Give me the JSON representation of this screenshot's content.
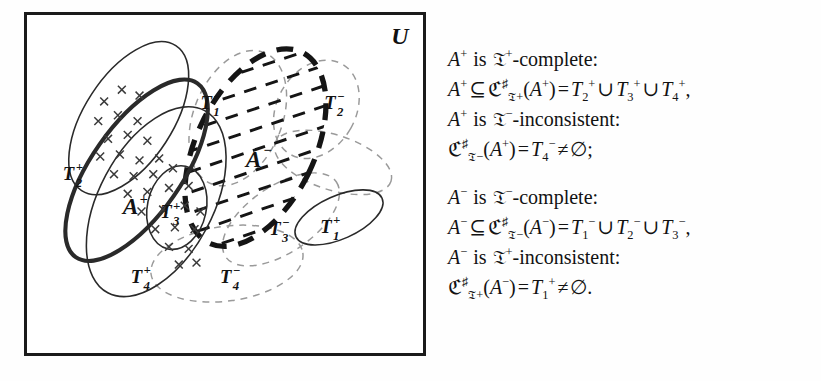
{
  "figure": {
    "universe_label": "U",
    "region_labels": {
      "A_plus": "A",
      "A_plus_sign": "+",
      "A_minus": "A",
      "A_minus_sign": "−",
      "T2_plus": "T",
      "T2_plus_idx": "2",
      "T2_plus_sign": "+",
      "T3_plus": "T",
      "T3_plus_idx": "3",
      "T3_plus_sign": "+",
      "T4_plus": "T",
      "T4_plus_idx": "4",
      "T4_plus_sign": "+",
      "T1_plus": "T",
      "T1_plus_idx": "1",
      "T1_plus_sign": "+",
      "T1_minus": "T",
      "T1_minus_idx": "1",
      "T1_minus_sign": "−",
      "T2_minus": "T",
      "T2_minus_idx": "2",
      "T2_minus_sign": "−",
      "T3_minus": "T",
      "T3_minus_idx": "3",
      "T3_minus_sign": "−",
      "T4_minus": "T",
      "T4_minus_idx": "4",
      "T4_minus_sign": "−"
    },
    "colors": {
      "frame": "#1b1b1b",
      "solid_stroke": "#2a2a2a",
      "dashed_grey": "#9a9a9a",
      "dashed_black": "#151515",
      "x_marks": "#3a3a3a",
      "background": "#ffffff"
    },
    "legend_notes": {
      "A_plus_style": "thick solid ellipse filled with x marks",
      "A_minus_style": "thick black dashed ellipse with diagonal hatching",
      "T_plus_style": "thin solid ellipses",
      "T_minus_style": "thin grey dashed ellipses"
    }
  },
  "text": {
    "blocks": [
      {
        "id": "a-plus-block",
        "lines": [
          {
            "id": "l1",
            "plain": "A+ is 𝔗+-complete:"
          },
          {
            "id": "l2",
            "plain": "A+ ⊆ ℭ♯𝔗+(A+) = T2+ ∪ T3+ ∪ T4+,"
          },
          {
            "id": "l3",
            "plain": "A+ is 𝔗−-inconsistent:"
          },
          {
            "id": "l4",
            "plain": "ℭ♯𝔗−(A+) = T4− ≠ ∅;"
          }
        ]
      },
      {
        "id": "a-minus-block",
        "lines": [
          {
            "id": "l5",
            "plain": "A− is 𝔗−-complete:"
          },
          {
            "id": "l6",
            "plain": "A− ⊆ ℭ♯𝔗−(A−) = T1− ∪ T2− ∪ T3−,"
          },
          {
            "id": "l7",
            "plain": "A− is 𝔗+-inconsistent:"
          },
          {
            "id": "l8",
            "plain": "ℭ♯𝔗+(A−) = T1+ ≠ ∅."
          }
        ]
      }
    ],
    "tokens": {
      "A": "A",
      "plus": "+",
      "minus": "−",
      "is": "is",
      "complete": "-complete:",
      "inconsistent": "-inconsistent:",
      "subseteq": "⊆",
      "equals": "=",
      "cup": "∪",
      "neq": "≠",
      "emptyset": "∅",
      "comma": ",",
      "semicolon": ";",
      "period": ".",
      "lparen": "(",
      "rparen": ")",
      "T": "T",
      "C_frak": "ℭ",
      "T_frak": "𝔗",
      "sharp": "♯",
      "idx1": "1",
      "idx2": "2",
      "idx3": "3",
      "idx4": "4"
    }
  }
}
